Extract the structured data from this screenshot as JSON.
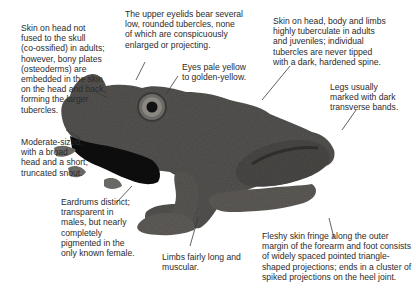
{
  "figure": {
    "subject_color": "#4a4a4a",
    "background": "#ffffff",
    "annotation_color": "#2b2b2b"
  },
  "annotations": [
    {
      "id": "skin-head",
      "text": "Skin on head not\nfused to the skull\n(co-ossified) in adults;\nhowever, bony plates\n(osteoderms) are\nembedded in the skin\non the head and back,\nforming the larger\ntubercles."
    },
    {
      "id": "eyelids",
      "text": "The upper eyelids bear several\nlow, rounded tubercles, none\nof which are conspicuously\nenlarged or projecting."
    },
    {
      "id": "eyes",
      "text": "Eyes pale yellow\nto golden-yellow."
    },
    {
      "id": "skin-body",
      "text": "Skin on head, body and limbs\nhighly tuberculate in adults\nand juveniles; individual\ntubercles are never tipped\nwith a dark, hardened spine."
    },
    {
      "id": "legs",
      "text": "Legs usually\nmarked with dark\ntransverse bands."
    },
    {
      "id": "size",
      "text": "Moderate-sized,\nwith a broad\nhead and a short,\ntruncated snout."
    },
    {
      "id": "eardrums",
      "text": "Eardrums distinct;\ntransparent in\nmales, but nearly\ncompletely\npigmented in the\nonly known female."
    },
    {
      "id": "limbs",
      "text": "Limbs fairly long and\nmuscular."
    },
    {
      "id": "skin-fringe",
      "text": "Fleshy skin fringe along the outer\nmargin of the forearm and foot consists\nof widely spaced pointed triangle-\nshaped projections; ends in a cluster of\nspiked projections on the heel joint."
    }
  ]
}
